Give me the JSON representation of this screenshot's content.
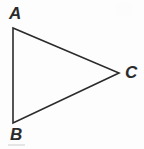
{
  "figure": {
    "background_color": "#fdfdfd",
    "stroke_color": "#2b2b2b",
    "label_color": "#2b2b2b",
    "stroke_width": 1.6,
    "width": 144,
    "height": 149
  },
  "shape": {
    "type": "triangle",
    "name": "triangle ABC",
    "fill": "none",
    "vertices": [
      {
        "id": "A",
        "label": "A",
        "x": 13,
        "y": 28
      },
      {
        "id": "B",
        "label": "B",
        "x": 13,
        "y": 123
      },
      {
        "id": "C",
        "label": "C",
        "x": 119,
        "y": 73
      }
    ],
    "edges": [
      {
        "id": "AB",
        "from": "A",
        "to": "B"
      },
      {
        "id": "AC",
        "from": "A",
        "to": "C"
      },
      {
        "id": "BC",
        "from": "B",
        "to": "C"
      }
    ],
    "path": "M 13 28 L 119 73 L 13 123 Z"
  },
  "labels": {
    "a": "A",
    "b": "B",
    "c": "C"
  }
}
